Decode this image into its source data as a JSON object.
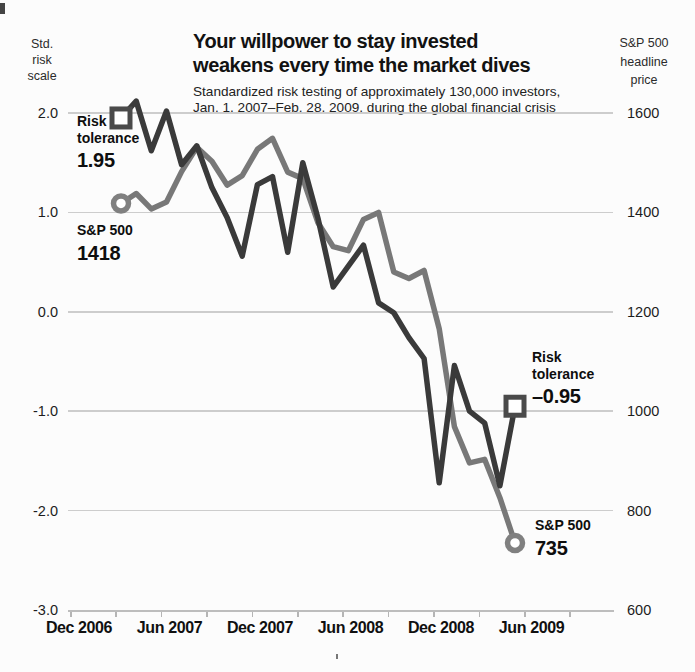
{
  "header": {
    "title_line1": "Your willpower to stay invested",
    "title_line2": "weakens every time the market dives",
    "subtitle_line1": "Standardized risk testing of approximately 130,000 investors,",
    "subtitle_line2": "Jan. 1, 2007–Feb. 28, 2009, during the global financial crisis"
  },
  "annotations": {
    "start_risk": {
      "line1": "Risk",
      "line2": "tolerance",
      "value": "1.95"
    },
    "start_sp": {
      "line1": "S&P 500",
      "value": "1418"
    },
    "end_risk": {
      "line1": "Risk",
      "line2": "tolerance",
      "value": "–0.95"
    },
    "end_sp": {
      "line1": "S&P 500",
      "value": "735"
    }
  },
  "chart_data": {
    "type": "line",
    "months": [
      "Dec 2006",
      "Jan 2007",
      "Feb 2007",
      "Mar 2007",
      "Apr 2007",
      "May 2007",
      "Jun 2007",
      "Jul 2007",
      "Aug 2007",
      "Sep 2007",
      "Oct 2007",
      "Nov 2007",
      "Dec 2007",
      "Jan 2008",
      "Feb 2008",
      "Mar 2008",
      "Apr 2008",
      "May 2008",
      "Jun 2008",
      "Jul 2008",
      "Aug 2008",
      "Sep 2008",
      "Oct 2008",
      "Nov 2008",
      "Dec 2008",
      "Jan 2009",
      "Feb 2009"
    ],
    "series": [
      {
        "name": "S&P 500",
        "axis": "right",
        "color": "#787878",
        "marker": "circle",
        "values": [
          1418,
          1438,
          1407,
          1421,
          1482,
          1531,
          1503,
          1455,
          1474,
          1527,
          1549,
          1481,
          1468,
          1379,
          1331,
          1323,
          1386,
          1400,
          1280,
          1267,
          1283,
          1166,
          969,
          896,
          903,
          826,
          735
        ]
      },
      {
        "name": "Risk tolerance",
        "axis": "left",
        "color": "#3a3a3a",
        "marker": "square",
        "values": [
          1.95,
          2.12,
          1.62,
          2.02,
          1.48,
          1.67,
          1.25,
          0.95,
          0.56,
          1.28,
          1.36,
          0.6,
          1.5,
          0.94,
          0.25,
          0.46,
          0.67,
          0.09,
          -0.01,
          -0.26,
          -0.47,
          -1.72,
          -0.54,
          -1.0,
          -1.12,
          -1.75,
          -0.95
        ]
      }
    ],
    "left_axis": {
      "title": [
        "Std.",
        "risk",
        "scale"
      ],
      "ticks": [
        "2.0",
        "1.0",
        "0.0",
        "-1.0",
        "-2.0",
        "-3.0"
      ],
      "range": [
        2.0,
        -3.0
      ]
    },
    "right_axis": {
      "title": [
        "S&P 500",
        "headline",
        "price"
      ],
      "ticks": [
        "1600",
        "1400",
        "1200",
        "1000",
        "800",
        "600"
      ],
      "range": [
        1600,
        600
      ]
    },
    "x_axis": {
      "tick_labels": [
        "Dec 2006",
        "Jun 2007",
        "Dec 2007",
        "Jun 2008",
        "Dec 2008",
        "Jun 2009"
      ]
    },
    "grid": true,
    "legend": "none",
    "layout": {
      "x0": 121,
      "x_step": 15.154,
      "y_top": 113,
      "px_per_unit": 99.4,
      "risk_max": 2.0,
      "sp_max": 1600,
      "px_per_sp_point": 0.497,
      "baseline_y": 611,
      "grid_left": 68,
      "grid_right": 613,
      "xtick_start": 70,
      "xtick_step": 45.4,
      "xlabel_start": 79,
      "xlabel_step": 90.5
    },
    "colors": {
      "grid": "#cdcdcd",
      "axis": "#bdbdbd",
      "sp_line": "#787878",
      "risk_line": "#3a3a3a",
      "square_border": "#4a4a4a",
      "circle_border": "#808080",
      "marker_fill": "#ffffff"
    }
  }
}
